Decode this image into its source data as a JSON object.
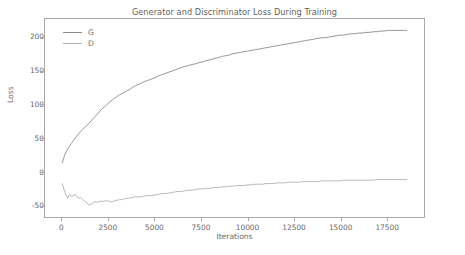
{
  "figure": {
    "background": "#ffffff",
    "frame_color": "#a8a8a8",
    "text_color": "#6a6a6a"
  },
  "axis_label_x": "Iterations",
  "axis_label_y": "Loss",
  "legend": {
    "position": "upper-left",
    "entries": [
      {
        "label": "G",
        "color": "#8a8a8a"
      },
      {
        "label": "D",
        "color": "#b0b0b0"
      }
    ]
  },
  "chart_data": {
    "type": "line",
    "title": "Generator and Discriminator Loss During Training",
    "xlabel": "Iterations",
    "ylabel": "Loss",
    "xlim": [
      -930,
      19530
    ],
    "ylim": [
      -68,
      228
    ],
    "xticks": [
      0,
      2500,
      5000,
      7500,
      10000,
      12500,
      15000,
      17500
    ],
    "xticklabels": [
      "0",
      "2500",
      "5000",
      "7500",
      "10000",
      "12500",
      "15000",
      "17500"
    ],
    "yticks": [
      -50,
      0,
      50,
      100,
      150,
      200
    ],
    "yticklabels": [
      "-50",
      "0",
      "50",
      "100",
      "150",
      "200"
    ],
    "grid": false,
    "legend_position": "upper left",
    "x": [
      0,
      100,
      200,
      300,
      400,
      500,
      600,
      700,
      800,
      900,
      1000,
      1100,
      1200,
      1300,
      1400,
      1500,
      1600,
      1700,
      1800,
      1900,
      2000,
      2100,
      2200,
      2300,
      2400,
      2500,
      2600,
      2700,
      2800,
      2900,
      3000,
      3100,
      3200,
      3300,
      3400,
      3500,
      3600,
      3700,
      3800,
      3900,
      4000,
      4200,
      4400,
      4600,
      4800,
      5000,
      5200,
      5400,
      5600,
      5800,
      6000,
      6200,
      6400,
      6600,
      6800,
      7000,
      7200,
      7400,
      7600,
      7800,
      8000,
      8200,
      8400,
      8600,
      8800,
      9000,
      9200,
      9400,
      9600,
      9800,
      10000,
      10200,
      10400,
      10600,
      10800,
      11000,
      11200,
      11400,
      11600,
      11800,
      12000,
      12200,
      12400,
      12600,
      12800,
      13000,
      13200,
      13400,
      13600,
      13800,
      14000,
      14200,
      14400,
      14600,
      14800,
      15000,
      15200,
      15400,
      15600,
      15800,
      16000,
      16200,
      16400,
      16600,
      16800,
      17000,
      17200,
      17400,
      17600,
      17800,
      18000,
      18200,
      18400,
      18600
    ],
    "series": [
      {
        "name": "G",
        "color": "#8a8a8a",
        "linewidth": 0.9,
        "values": [
          13,
          22,
          29,
          34,
          38,
          42,
          46,
          50,
          53,
          57,
          60,
          63,
          66,
          68,
          71,
          74,
          77,
          80,
          83,
          86,
          89,
          92,
          95,
          97,
          100,
          102,
          105,
          107,
          109,
          111,
          113,
          115,
          116,
          118,
          119,
          121,
          122,
          124,
          126,
          127,
          129,
          131,
          134,
          136,
          138,
          140,
          143,
          145,
          147,
          149,
          151,
          153,
          155,
          157,
          158,
          160,
          161,
          163,
          164,
          166,
          167,
          169,
          170,
          172,
          173,
          174,
          176,
          177,
          178,
          179,
          180,
          181,
          182,
          183,
          184,
          185,
          186,
          187,
          188,
          189,
          190,
          191,
          192,
          193,
          194,
          195,
          196,
          197,
          198,
          199,
          200,
          200,
          201,
          202,
          203,
          204,
          204,
          205,
          206,
          206,
          207,
          207,
          208,
          208,
          209,
          209,
          210,
          210,
          211,
          211,
          211,
          211,
          211,
          211
        ]
      },
      {
        "name": "D",
        "color": "#b0b0b0",
        "linewidth": 0.9,
        "values": [
          -18,
          -27,
          -35,
          -40,
          -34,
          -37,
          -36,
          -34,
          -38,
          -40,
          -39,
          -42,
          -44,
          -46,
          -49,
          -50,
          -48,
          -46,
          -45,
          -46,
          -45,
          -44,
          -45,
          -44,
          -44,
          -44,
          -45,
          -45,
          -44,
          -43,
          -43,
          -42,
          -42,
          -41,
          -41,
          -40,
          -40,
          -39,
          -39,
          -38,
          -38,
          -38,
          -37,
          -36,
          -36,
          -35,
          -34,
          -33,
          -33,
          -32,
          -31,
          -30,
          -30,
          -29,
          -28,
          -28,
          -27,
          -26,
          -26,
          -25,
          -25,
          -24,
          -24,
          -23,
          -23,
          -22,
          -22,
          -21,
          -21,
          -21,
          -20,
          -20,
          -19,
          -19,
          -19,
          -18,
          -18,
          -18,
          -17,
          -17,
          -17,
          -16,
          -16,
          -16,
          -16,
          -15,
          -15,
          -15,
          -15,
          -15,
          -14,
          -14,
          -14,
          -14,
          -14,
          -14,
          -13,
          -13,
          -13,
          -13,
          -13,
          -13,
          -13,
          -13,
          -13,
          -12,
          -12,
          -12,
          -12,
          -12,
          -12,
          -12,
          -12,
          -12
        ]
      }
    ]
  }
}
